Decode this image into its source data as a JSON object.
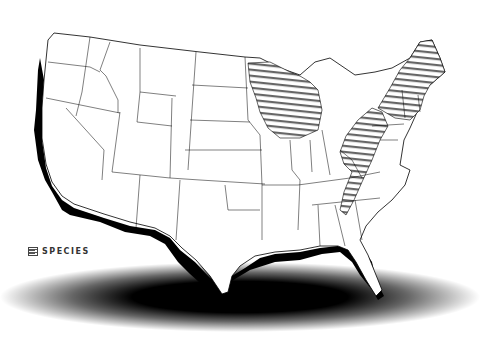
{
  "map": {
    "title": "United States species range map",
    "region": "Contiguous United States",
    "colors": {
      "land": "#ffffff",
      "border": "#000000",
      "hatch": "#555555",
      "coast_shadow": "#000000",
      "ground_shadow": "#000000"
    },
    "range_regions": [
      "Upper Midwest (Minnesota, Wisconsin, Michigan)",
      "Northeast (New York, New England)",
      "Appalachians (Pennsylvania, Ohio, West Virginia, Virginia, North Carolina)"
    ]
  },
  "legend": {
    "items": [
      {
        "icon": "hatch-swatch-icon",
        "label": "SPECIES"
      }
    ]
  }
}
